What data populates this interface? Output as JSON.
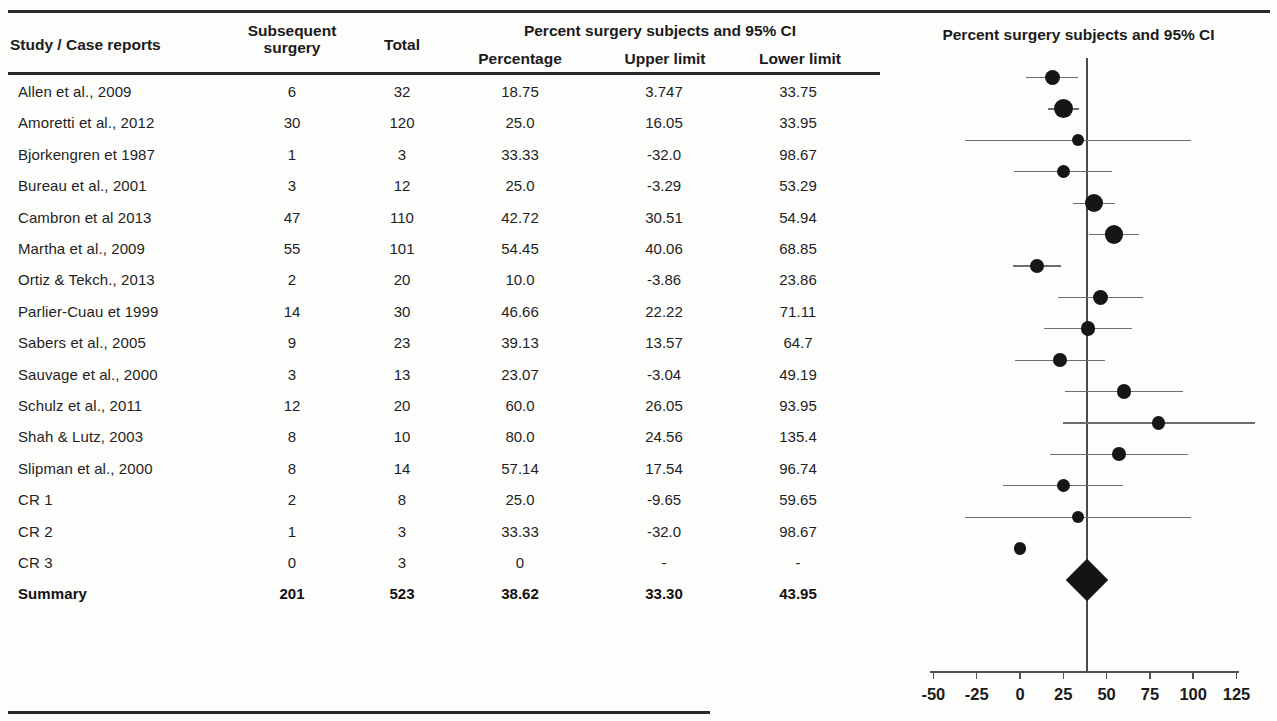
{
  "figure": {
    "table_header": {
      "study_label": "Study / Case reports",
      "subsequent_surgery": "Subsequent surgery",
      "subsequent_surgery_line1": "Subsequent",
      "subsequent_surgery_line2": "surgery",
      "total": "Total",
      "group_label": "Percent surgery subjects and 95% CI",
      "percentage": "Percentage",
      "upper_limit": "Upper limit",
      "lower_limit": "Lower limit"
    },
    "plot_title": "Percent surgery subjects and 95% CI"
  },
  "rows": [
    {
      "study": "Allen et al., 2009",
      "subsequent_surgery": "6",
      "total": "32",
      "percentage": "18.75",
      "upper_limit": "3.747",
      "lower_limit": "33.75"
    },
    {
      "study": "Amoretti et al., 2012",
      "subsequent_surgery": "30",
      "total": "120",
      "percentage": "25.0",
      "upper_limit": "16.05",
      "lower_limit": "33.95"
    },
    {
      "study": "Bjorkengren et 1987",
      "subsequent_surgery": "1",
      "total": "3",
      "percentage": "33.33",
      "upper_limit": "-32.0",
      "lower_limit": "98.67"
    },
    {
      "study": "Bureau et al., 2001",
      "subsequent_surgery": "3",
      "total": "12",
      "percentage": "25.0",
      "upper_limit": "-3.29",
      "lower_limit": "53.29"
    },
    {
      "study": "Cambron et al 2013",
      "subsequent_surgery": "47",
      "total": "110",
      "percentage": "42.72",
      "upper_limit": "30.51",
      "lower_limit": "54.94"
    },
    {
      "study": "Martha et al., 2009",
      "subsequent_surgery": "55",
      "total": "101",
      "percentage": "54.45",
      "upper_limit": "40.06",
      "lower_limit": "68.85"
    },
    {
      "study": "Ortiz & Tekch., 2013",
      "subsequent_surgery": "2",
      "total": "20",
      "percentage": "10.0",
      "upper_limit": "-3.86",
      "lower_limit": "23.86"
    },
    {
      "study": "Parlier-Cuau et 1999",
      "subsequent_surgery": "14",
      "total": "30",
      "percentage": "46.66",
      "upper_limit": "22.22",
      "lower_limit": "71.11"
    },
    {
      "study": "Sabers et al., 2005",
      "subsequent_surgery": "9",
      "total": "23",
      "percentage": "39.13",
      "upper_limit": "13.57",
      "lower_limit": "64.7"
    },
    {
      "study": "Sauvage et al., 2000",
      "subsequent_surgery": "3",
      "total": "13",
      "percentage": "23.07",
      "upper_limit": "-3.04",
      "lower_limit": "49.19"
    },
    {
      "study": "Schulz et al., 2011",
      "subsequent_surgery": "12",
      "total": "20",
      "percentage": "60.0",
      "upper_limit": "26.05",
      "lower_limit": "93.95"
    },
    {
      "study": "Shah & Lutz, 2003",
      "subsequent_surgery": "8",
      "total": "10",
      "percentage": "80.0",
      "upper_limit": "24.56",
      "lower_limit": "135.4"
    },
    {
      "study": "Slipman et al., 2000",
      "subsequent_surgery": "8",
      "total": "14",
      "percentage": "57.14",
      "upper_limit": "17.54",
      "lower_limit": "96.74"
    },
    {
      "study": "CR 1",
      "subsequent_surgery": "2",
      "total": "8",
      "percentage": "25.0",
      "upper_limit": "-9.65",
      "lower_limit": "59.65"
    },
    {
      "study": "CR 2",
      "subsequent_surgery": "1",
      "total": "3",
      "percentage": "33.33",
      "upper_limit": "-32.0",
      "lower_limit": "98.67"
    },
    {
      "study": "CR 3",
      "subsequent_surgery": "0",
      "total": "3",
      "percentage": "0",
      "upper_limit": "-",
      "lower_limit": "-"
    },
    {
      "study": "Summary",
      "subsequent_surgery": "201",
      "total": "523",
      "percentage": "38.62",
      "upper_limit": "33.30",
      "lower_limit": "43.95"
    }
  ],
  "chart_data": {
    "type": "scatter",
    "subtype": "forest-plot",
    "title": "Percent surgery subjects and 95% CI",
    "xlabel": "",
    "ylabel": "",
    "xlim": [
      -62,
      135
    ],
    "xticks": [
      -50,
      -25,
      0,
      25,
      50,
      75,
      100,
      125
    ],
    "xticklabels": [
      "-50",
      "-25",
      "0",
      "25",
      "50",
      "75",
      "100",
      "125"
    ],
    "grid": false,
    "legend": false,
    "reference_line": 38.62,
    "reference_line_kind": "summary-estimate",
    "categories": [
      "Allen et al., 2009",
      "Amoretti et al., 2012",
      "Bjorkengren et 1987",
      "Bureau et al., 2001",
      "Cambron et al 2013",
      "Martha et al., 2009",
      "Ortiz & Tekch., 2013",
      "Parlier-Cuau et 1999",
      "Sabers et al., 2005",
      "Sauvage et al., 2000",
      "Schulz et al., 2011",
      "Shah & Lutz, 2003",
      "Slipman et al., 2000",
      "CR 1",
      "CR 2",
      "CR 3"
    ],
    "values": [
      18.75,
      25.0,
      33.33,
      25.0,
      42.72,
      54.45,
      10.0,
      46.66,
      39.13,
      23.07,
      60.0,
      80.0,
      57.14,
      25.0,
      33.33,
      0
    ],
    "ci_lower": [
      3.747,
      16.05,
      -32.0,
      -3.29,
      30.51,
      40.06,
      -3.86,
      22.22,
      13.57,
      -3.04,
      26.05,
      24.56,
      17.54,
      -9.65,
      -32.0,
      null
    ],
    "ci_upper": [
      33.75,
      33.95,
      98.67,
      53.29,
      54.94,
      68.85,
      23.86,
      71.11,
      64.7,
      49.19,
      93.95,
      135.4,
      96.74,
      59.65,
      98.67,
      null
    ],
    "weights_n": [
      32,
      120,
      3,
      12,
      110,
      101,
      20,
      30,
      23,
      13,
      20,
      10,
      14,
      8,
      3,
      3
    ],
    "events": [
      6,
      30,
      1,
      3,
      47,
      55,
      2,
      14,
      9,
      3,
      12,
      8,
      8,
      2,
      1,
      0
    ],
    "summary": {
      "label": "Summary",
      "events": 201,
      "total": 523,
      "value": 38.62,
      "ci_lower": 33.3,
      "ci_upper": 43.95,
      "marker": "diamond"
    },
    "marker_color": "#161616",
    "line_color": "#6e6e6e"
  }
}
